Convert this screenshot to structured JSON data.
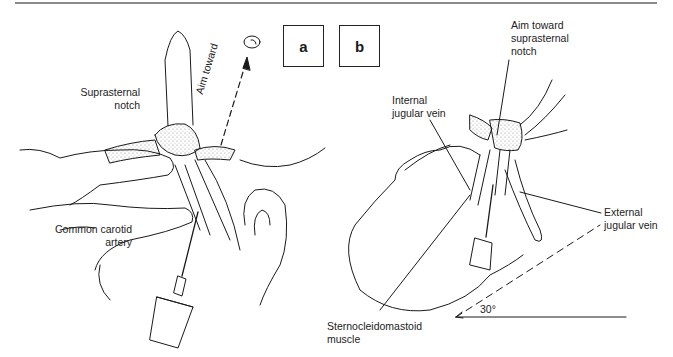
{
  "figure": {
    "panels": [
      {
        "id": "a",
        "label": "a"
      },
      {
        "id": "b",
        "label": "b"
      }
    ],
    "panel_a_labels": {
      "suprasternal_notch_1": "Suprasternal",
      "suprasternal_notch_2": "notch",
      "aim_toward": "Aim toward",
      "common_carotid_1": "Common carotid",
      "common_carotid_2": "artery"
    },
    "panel_b_labels": {
      "aim_toward_1": "Aim toward",
      "aim_toward_2": "suprasternal",
      "aim_toward_3": "notch",
      "internal_jugular_1": "Internal",
      "internal_jugular_2": "jugular vein",
      "external_jugular_1": "External",
      "external_jugular_2": "jugular vein",
      "scm_1": "Sternocleidomastoid",
      "scm_2": "muscle",
      "angle": "30°"
    },
    "colors": {
      "line": "#1a1a1a",
      "rule": "#8a8a8a",
      "stipple": "#9a9a9a"
    }
  }
}
